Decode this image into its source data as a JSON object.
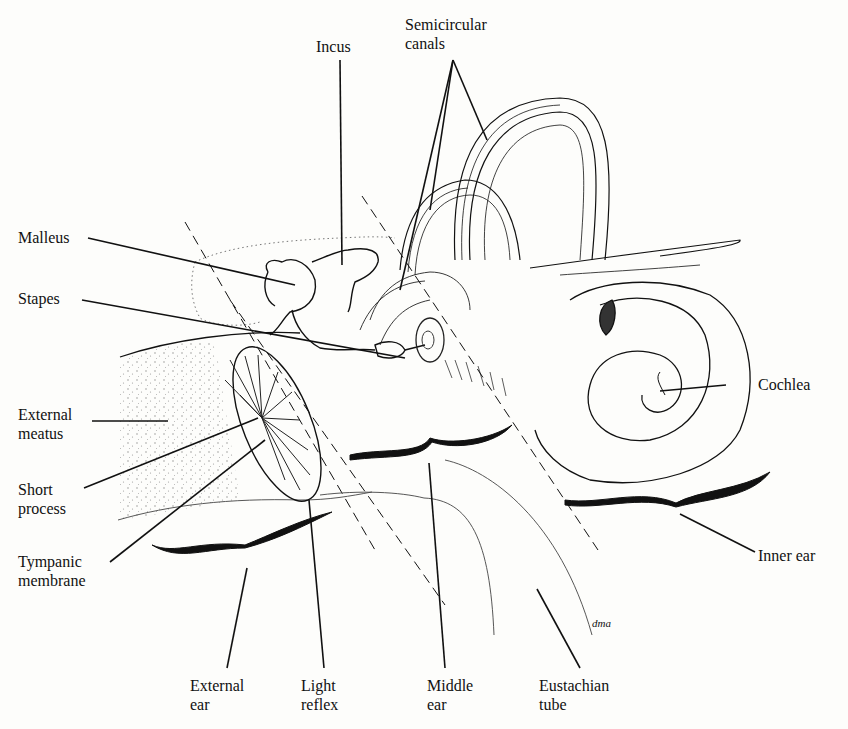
{
  "figure": {
    "signature": "dma",
    "colors": {
      "ink": "#111111",
      "paper": "#fdfdfb",
      "stipple": "#9a9a9a"
    }
  },
  "labels": {
    "incus": {
      "line1": "Incus"
    },
    "semicircular_canals": {
      "line1": "Semicircular",
      "line2": "canals"
    },
    "malleus": {
      "line1": "Malleus"
    },
    "stapes": {
      "line1": "Stapes"
    },
    "external_meatus": {
      "line1": "External",
      "line2": "meatus"
    },
    "short_process": {
      "line1": "Short",
      "line2": "process"
    },
    "tympanic_membrane": {
      "line1": "Tympanic",
      "line2": "membrane"
    },
    "cochlea": {
      "line1": "Cochlea"
    },
    "inner_ear": {
      "line1": "Inner ear"
    },
    "external_ear": {
      "line1": "External",
      "line2": "ear"
    },
    "light_reflex": {
      "line1": "Light",
      "line2": "reflex"
    },
    "middle_ear": {
      "line1": "Middle",
      "line2": "ear"
    },
    "eustachian_tube": {
      "line1": "Eustachian",
      "line2": "tube"
    }
  }
}
